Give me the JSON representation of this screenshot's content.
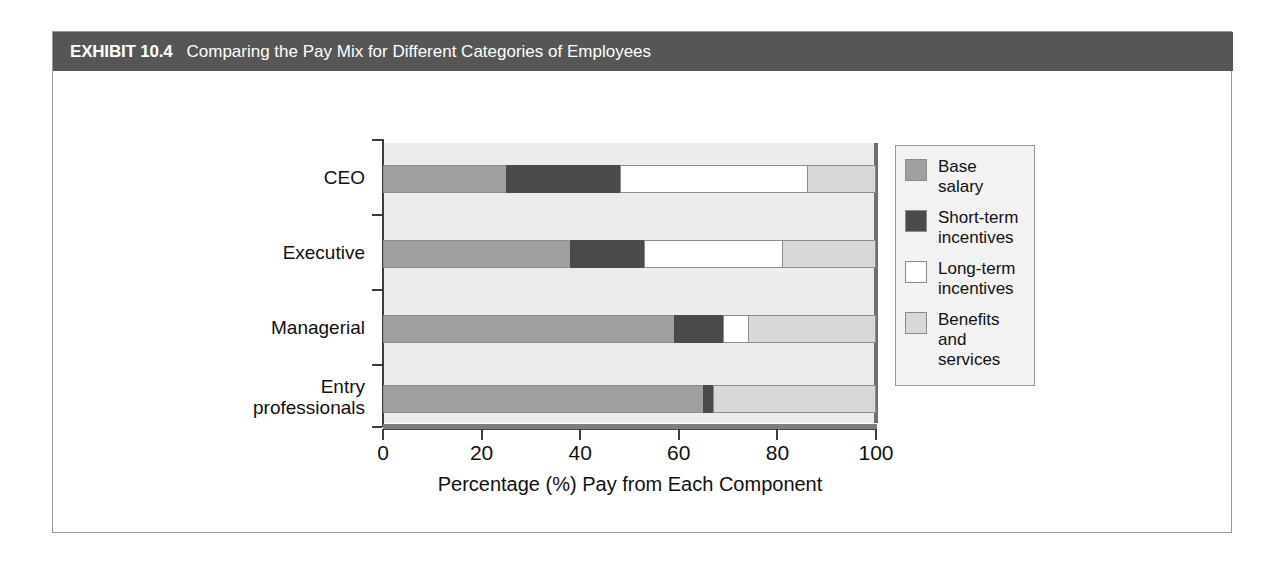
{
  "exhibit": {
    "number": "EXHIBIT 10.4",
    "title": "Comparing the Pay Mix for Different Categories of Employees"
  },
  "legend": {
    "items": [
      {
        "label": "Base salary",
        "color": "#a0a0a0",
        "swatch_name": "legend-swatch-base-salary"
      },
      {
        "label": "Short-term\nincentives",
        "color": "#4a4a4a",
        "swatch_name": "legend-swatch-short-term-incentives"
      },
      {
        "label": "Long-term\nincentives",
        "color": "#ffffff",
        "swatch_name": "legend-swatch-long-term-incentives"
      },
      {
        "label": "Benefits and\nservices",
        "color": "#d8d8d8",
        "swatch_name": "legend-swatch-benefits-and-services"
      }
    ]
  },
  "chart_data": {
    "type": "bar",
    "orientation": "horizontal",
    "stacked": true,
    "title": "Comparing the Pay Mix for Different Categories of Employees",
    "xlabel": "Percentage (%) Pay from Each Component",
    "ylabel": "",
    "xlim": [
      0,
      100
    ],
    "xticks": [
      0,
      20,
      40,
      60,
      80,
      100
    ],
    "xtick_labels": [
      "0",
      "20",
      "40",
      "60",
      "80",
      "100"
    ],
    "grid": false,
    "legend_position": "right",
    "categories": [
      "CEO",
      "Executive",
      "Managerial",
      "Entry\nprofessionals"
    ],
    "series": [
      {
        "name": "Base salary",
        "color": "#a0a0a0",
        "values": [
          25,
          38,
          59,
          65
        ]
      },
      {
        "name": "Short-term incentives",
        "color": "#4a4a4a",
        "values": [
          23,
          15,
          10,
          2
        ]
      },
      {
        "name": "Long-term incentives",
        "color": "#ffffff",
        "values": [
          38,
          28,
          5,
          0
        ]
      },
      {
        "name": "Benefits and services",
        "color": "#d8d8d8",
        "values": [
          14,
          19,
          26,
          33
        ]
      }
    ]
  }
}
